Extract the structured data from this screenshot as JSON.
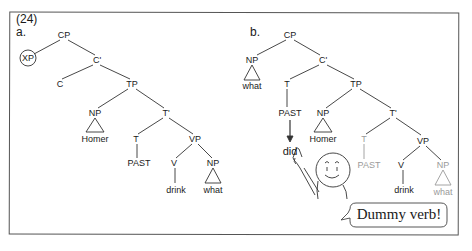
{
  "example_number": "(24)",
  "trees": [
    {
      "label": "a.",
      "nodes": {
        "cp": "CP",
        "xp": "XP",
        "c_bar": "C'",
        "c": "C",
        "tp": "TP",
        "np_subject": "NP",
        "subject": "Homer",
        "t_bar": "T'",
        "t": "T",
        "past": "PAST",
        "vp": "VP",
        "v": "V",
        "verb": "drink",
        "np_object": "NP",
        "object": "what"
      },
      "highlight": {
        "circled_node": "XP"
      }
    },
    {
      "label": "b.",
      "nodes": {
        "cp": "CP",
        "np_moved": "NP",
        "moved_word": "what",
        "c_bar": "C'",
        "t_moved": "T",
        "past_moved": "PAST",
        "did": "did",
        "tp": "TP",
        "np_subject": "NP",
        "subject": "Homer",
        "t_bar": "T'",
        "t_trace": "T",
        "past_trace": "PAST",
        "vp": "VP",
        "v": "V",
        "verb": "drink",
        "np_trace": "NP",
        "object_trace": "what"
      },
      "annotations": {
        "arrow": "PAST → did",
        "speech_bubble": "Dummy verb!",
        "trace_color": "#9a9a9a"
      }
    }
  ],
  "colors": {
    "ink": "#1a1a1a",
    "trace": "#9a9a9a",
    "frame": "#555555",
    "background": "#ffffff"
  }
}
